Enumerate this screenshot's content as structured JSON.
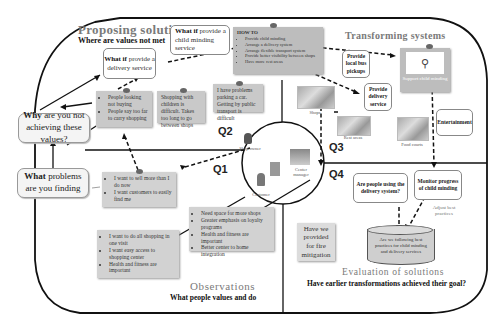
{
  "sections": {
    "proposing": {
      "title": "Proposing solutions",
      "subtitle": "Where are values not met"
    },
    "transforming": {
      "title": "Transforming systems"
    },
    "observations": {
      "title": "Observations",
      "subtitle": "What people values and do"
    },
    "evaluation": {
      "title": "Evaluation of solutions",
      "subtitle": "Have earlier transformations achieved their goal?"
    }
  },
  "questions": {
    "why": {
      "bold": "Why",
      "rest": " are you not achieving these values?"
    },
    "what": {
      "bold": "What",
      "rest": " problems are you finding"
    }
  },
  "what_if": {
    "delivery": {
      "bold": "What if",
      "rest": " provide a delivery service"
    },
    "child": {
      "bold": "What if",
      "rest": " provide a child minding service"
    }
  },
  "how_to": {
    "title": "HOW TO",
    "items": [
      "Provide child minding",
      "Arrange a delivery system",
      "Arrange flexible transport system",
      "Provide better visibility between shops",
      "Have more rest areas"
    ]
  },
  "notes": {
    "people_looking": [
      "People looking not buying",
      "People say too far to carry shopping"
    ],
    "shopping_children": "Shopping with children is difficult. Takes too long to go between shops",
    "parking": "I have problems parking a car. Getting by public transport is difficult",
    "sell_more": [
      "I want to sell more than I do now",
      "I want customers to easily find me"
    ],
    "do_all": [
      "I want to do all shopping in one visit",
      "I want easy access to shopping center",
      "Health and fitness are important"
    ],
    "need_space": [
      "Need space for more shops",
      "Greater emphasis on loyalty programs",
      "Health and fitness are important",
      "Better center to home integration"
    ],
    "fire": "Have we provided for fire mitigation"
  },
  "quadrants": [
    "Q1",
    "Q2",
    "Q3",
    "Q4"
  ],
  "circle_labels": {
    "shop_owner": "Shop owner",
    "center_manager": "Center manager",
    "customer": "Customer"
  },
  "transform_boxes": {
    "bus": "Provide local bus pickups",
    "delivery": "Provide delivery service",
    "support_child": "Support child minding",
    "entertainment": "Entertainment"
  },
  "pictures": {
    "shops": "Shops",
    "rest": "Rest areas",
    "food": "Food courts"
  },
  "evaluation_boxes": {
    "using_delivery": "Are people using the delivery system?",
    "monitor": "Monitor progress of child minding",
    "adjust": "Adjust best practices",
    "cylinder": "Are we following best practices for child minding and delivery services"
  }
}
